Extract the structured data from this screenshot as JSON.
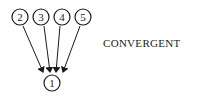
{
  "diagram": {
    "title": "CONVERGENT",
    "nodes": [
      {
        "id": "1",
        "label": "1",
        "cx": 52,
        "cy": 83
      },
      {
        "id": "2",
        "label": "2",
        "cx": 20,
        "cy": 17
      },
      {
        "id": "3",
        "label": "3",
        "cx": 41,
        "cy": 17
      },
      {
        "id": "4",
        "label": "4",
        "cx": 62,
        "cy": 17
      },
      {
        "id": "5",
        "label": "5",
        "cx": 83,
        "cy": 17
      }
    ],
    "edges": [
      {
        "from": "2",
        "to": "1"
      },
      {
        "from": "3",
        "to": "1"
      },
      {
        "from": "4",
        "to": "1"
      },
      {
        "from": "5",
        "to": "1"
      }
    ],
    "colors": {
      "stroke": "#1a1a1a",
      "background": "#ffffff"
    }
  }
}
